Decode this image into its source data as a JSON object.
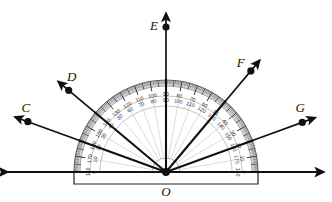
{
  "figure": {
    "type": "protractor-diagram",
    "center_label": "O",
    "baseline": {
      "left_label": "A",
      "right_label": "B"
    }
  },
  "geometry": {
    "center": {
      "x": 166,
      "y": 172
    },
    "radius": 92,
    "inner_radius": 66,
    "hub_radius": 14
  },
  "points": [
    {
      "name": "A",
      "label": "A",
      "angle": 180,
      "dot_r": 180,
      "label_dx": -10,
      "label_dy": -8,
      "arrow": true
    },
    {
      "name": "C",
      "label": "C",
      "angle": 160,
      "dot_r": 147,
      "label_dx": -2,
      "label_dy": -10,
      "arrow": true
    },
    {
      "name": "D",
      "label": "D",
      "angle": 140,
      "dot_r": 127,
      "label_dx": 3,
      "label_dy": -9,
      "arrow": true
    },
    {
      "name": "E",
      "label": "E",
      "angle": 90,
      "dot_r": 145,
      "label_dx": -12,
      "label_dy": 3,
      "arrow": true
    },
    {
      "name": "F",
      "label": "F",
      "angle": 50,
      "dot_r": 132,
      "label_dx": -10,
      "label_dy": -4,
      "arrow": true
    },
    {
      "name": "G",
      "label": "G",
      "angle": 20,
      "dot_r": 145,
      "label_dx": -2,
      "label_dy": -10,
      "arrow": true
    },
    {
      "name": "B",
      "label": "B",
      "angle": 0,
      "dot_r": 180,
      "label_dx": 2,
      "label_dy": -9,
      "arrow": true
    }
  ],
  "rays": [
    {
      "name": "ray-OC",
      "angle": 160,
      "bold": true
    },
    {
      "name": "ray-OD",
      "angle": 140,
      "bold": true
    },
    {
      "name": "ray-OE",
      "angle": 90,
      "bold": true
    },
    {
      "name": "ray-OF",
      "angle": 50,
      "bold": true
    },
    {
      "name": "ray-OG",
      "angle": 20,
      "bold": true
    }
  ],
  "faint_rays": [
    10,
    20,
    30,
    40,
    50,
    60,
    70,
    80,
    90,
    100,
    110,
    120,
    130,
    140,
    150,
    160,
    170
  ],
  "scales": {
    "outer": {
      "name": "outer-scale",
      "description": "reads 0 at right, 180 at left",
      "labels": [
        0,
        10,
        20,
        30,
        40,
        50,
        60,
        70,
        80,
        90,
        100,
        110,
        120,
        130,
        140,
        150,
        160,
        170,
        180
      ]
    },
    "inner": {
      "name": "inner-scale",
      "description": "reads 0 at left, 180 at right",
      "labels": [
        0,
        10,
        20,
        30,
        40,
        50,
        60,
        70,
        80,
        90,
        100,
        110,
        120,
        130,
        140,
        150,
        160,
        170,
        180
      ]
    }
  },
  "colors": {
    "ink": "#111111",
    "rim": "#c9c9c9",
    "faint": "#b9b9b9",
    "tick": "#2a2a2a",
    "background": "#ffffff"
  }
}
